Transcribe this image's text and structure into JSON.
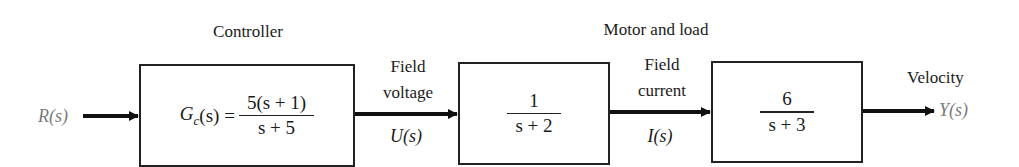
{
  "diagram": {
    "type": "block_diagram",
    "input": {
      "symbol": "R(s)"
    },
    "output": {
      "symbol": "Y(s)",
      "label": "Velocity"
    },
    "groups": {
      "controller": "Controller",
      "motor_and_load": "Motor and load"
    },
    "blocks": [
      {
        "id": "controller",
        "lhs": "G",
        "lhs_sub": "c",
        "lhs_arg": "(s) =",
        "numerator": "5(s + 1)",
        "denominator": "s + 5"
      },
      {
        "id": "field",
        "numerator": "1",
        "denominator": "s + 2"
      },
      {
        "id": "motor",
        "numerator": "6",
        "denominator": "s + 3"
      }
    ],
    "signals": [
      {
        "id": "u",
        "label_line1": "Field",
        "label_line2": "voltage",
        "symbol": "U(s)"
      },
      {
        "id": "i",
        "label_line1": "Field",
        "label_line2": "current",
        "symbol": "I(s)"
      }
    ]
  }
}
